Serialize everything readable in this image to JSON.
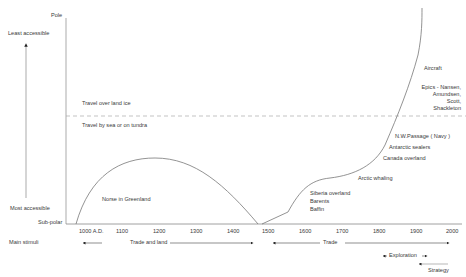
{
  "yaxis": {
    "top_label": "Pole",
    "bottom_label": "Sub-polar",
    "arrow_top_label": "Least accessible",
    "arrow_bottom_label": "Most accessible"
  },
  "xaxis": {
    "ticks": [
      "1000 A.D.",
      "1100",
      "1200",
      "1300",
      "1400",
      "1500",
      "1600",
      "1700",
      "1800",
      "1900",
      "2000"
    ],
    "row_label": "Main stimuli"
  },
  "zones": {
    "above_line": "Travel over land ice",
    "below_line": "Travel by sea or on tundra"
  },
  "annotations": {
    "norse": "Norse in Greenland",
    "siberia": "Siberia overland",
    "barents": "Barents",
    "baffin": "Baffin",
    "arctic_whaling": "Arctic whaling",
    "canada": "Canada overland",
    "antarctic": "Antarctic sealers",
    "nw_passage": "N.W.Passage ( Navy )",
    "epics_1": "Epics - Nansen,",
    "epics_2": "Amundsen,",
    "epics_3": "Scott,",
    "epics_4": "Shackleton",
    "aircraft": "Aircraft"
  },
  "stimuli": {
    "trade_and_land": "Trade and land",
    "trade": "Trade",
    "exploration": "Exploration",
    "strategy": "Strategy"
  },
  "colors": {
    "line": "#777777",
    "text": "#3a3a3a"
  }
}
